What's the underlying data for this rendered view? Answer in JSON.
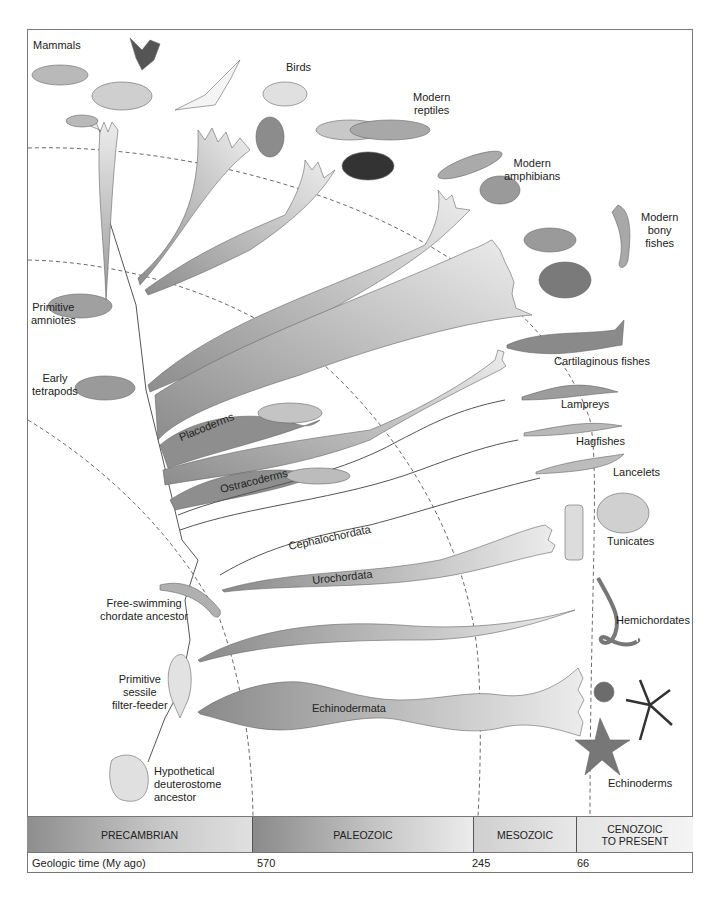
{
  "diagram": {
    "tip_labels": {
      "mammals": "Mammals",
      "birds": "Birds",
      "modern_reptiles": [
        "Modern",
        "reptiles"
      ],
      "modern_amphibians": [
        "Modern",
        "amphibians"
      ],
      "modern_bony_fishes": [
        "Modern",
        "bony",
        "fishes"
      ],
      "cartilaginous_fishes": "Cartilaginous fishes",
      "lampreys": "Lampreys",
      "hagfishes": "Hagfishes",
      "lancelets": "Lancelets",
      "tunicates": "Tunicates",
      "hemichordates": "Hemichordates",
      "echinoderms": "Echinoderms"
    },
    "ancestor_labels": {
      "primitive_amniotes": [
        "Primitive",
        "amniotes"
      ],
      "early_tetrapods": [
        "Early",
        "tetrapods"
      ],
      "free_swimming": [
        "Free-swimming",
        "chordate ancestor"
      ],
      "sessile_filter_feeder": [
        "Primitive",
        "sessile",
        "filter-feeder"
      ],
      "hypothetical_ancestor": [
        "Hypothetical",
        "deuterostome",
        "ancestor"
      ]
    },
    "branch_labels": {
      "placoderms": "Placoderms",
      "ostracoderms": "Ostracoderms",
      "cephalochordata": "Cephalochordata",
      "urochordata": "Urochordata",
      "echinodermata": "Echinodermata"
    },
    "colors": {
      "branch_fill_dark": "#8e8e8e",
      "branch_fill_light": "#e6e6e6",
      "line": "#555555",
      "era_dark": "#8a8a8a",
      "era_light": "#ececec"
    }
  },
  "timeline": {
    "eras": [
      {
        "label": "PRECAMBRIAN",
        "width": 226
      },
      {
        "label": "PALEOZOIC",
        "width": 221
      },
      {
        "label": "MESOZOIC",
        "width": 103
      },
      {
        "label": "CENOZOIC\nTO PRESENT",
        "label_line1": "CENOZOIC",
        "label_line2": "TO PRESENT",
        "width": 116
      }
    ],
    "axis_label": "Geologic time (My ago)",
    "ticks": [
      {
        "value": "570",
        "x": 230
      },
      {
        "value": "245",
        "x": 445
      },
      {
        "value": "66",
        "x": 550
      }
    ]
  }
}
